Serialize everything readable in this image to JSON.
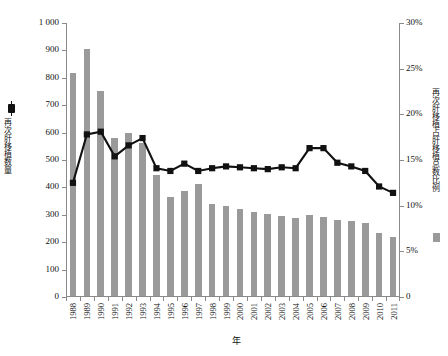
{
  "chart_data": {
    "type": "bar",
    "title": "",
    "subtitle": "",
    "xlabel": "年",
    "ylabel": "再次肝移植数量",
    "y2label": "再次肝移植占肝移植总数比例",
    "grid": false,
    "legend_position": "axis-labels",
    "ylim": [
      0,
      1000
    ],
    "y2lim": [
      0,
      30
    ],
    "yticks": [
      "0",
      "100",
      "200",
      "300",
      "400",
      "500",
      "600",
      "700",
      "800",
      "900",
      "1 000"
    ],
    "ytick_values": [
      0,
      100,
      200,
      300,
      400,
      500,
      600,
      700,
      800,
      900,
      1000
    ],
    "y2ticks": [
      "0",
      "5%",
      "10%",
      "15%",
      "20%",
      "25%",
      "30%"
    ],
    "y2tick_values": [
      0,
      5,
      10,
      15,
      20,
      25,
      30
    ],
    "categories": [
      "1988",
      "1989",
      "1990",
      "1991",
      "1992",
      "1993",
      "1994",
      "1995",
      "1996",
      "1997",
      "1998",
      "1999",
      "2000",
      "2001",
      "2002",
      "2003",
      "2004",
      "2005",
      "2006",
      "2007",
      "2008",
      "2009",
      "2010",
      "2011"
    ],
    "series": [
      {
        "name": "再次肝移植数量",
        "type": "bar",
        "axis": "left",
        "color": "#9a9a9a",
        "values": [
          815,
          900,
          750,
          578,
          595,
          560,
          440,
          360,
          385,
          410,
          335,
          330,
          318,
          305,
          300,
          292,
          283,
          295,
          290,
          278,
          272,
          268,
          230,
          215
        ]
      },
      {
        "name": "再次肝移植占肝移植总数比例",
        "type": "line",
        "axis": "right",
        "color": "#111111",
        "marker": "square",
        "values": [
          12.5,
          17.8,
          18.1,
          15.4,
          16.6,
          17.4,
          14.1,
          13.8,
          14.6,
          13.8,
          14.1,
          14.3,
          14.2,
          14.1,
          14.0,
          14.2,
          14.1,
          16.3,
          16.3,
          14.7,
          14.3,
          13.8,
          12.1,
          11.4
        ]
      }
    ]
  },
  "axes": {
    "left_label": "再次肝移植数量",
    "right_label": "再次肝移植占肝移植总数比例",
    "bottom_label": "年"
  }
}
